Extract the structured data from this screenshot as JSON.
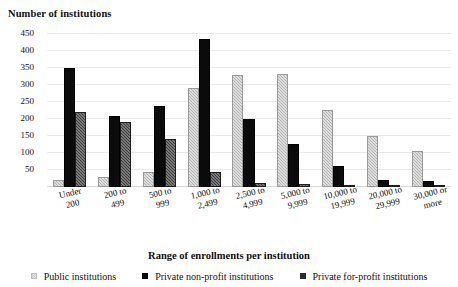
{
  "chart_data": {
    "type": "bar",
    "title": "",
    "ylabel": "Number of institutions",
    "xlabel": "Range of enrollments per institution",
    "ylim": [
      0,
      470
    ],
    "yticks": [
      50,
      100,
      150,
      200,
      250,
      300,
      350,
      400,
      450
    ],
    "grid": true,
    "legend_position": "bottom",
    "categories": [
      "Under\n200",
      "200 to\n499",
      "500 to\n999",
      "1,000 to\n2,499",
      "2,500 to\n4,999",
      "5,000 to\n9,999",
      "10,000 to\n19,999",
      "20,000 to\n29,999",
      "30,000 or\nmore"
    ],
    "series": [
      {
        "name": "Public institutions",
        "color": "#b4b4b4",
        "values": [
          22,
          28,
          44,
          290,
          330,
          332,
          225,
          150,
          105
        ]
      },
      {
        "name": "Private non-profit institutions",
        "color": "#0b0b0b",
        "values": [
          350,
          208,
          238,
          435,
          200,
          125,
          62,
          22,
          18
        ]
      },
      {
        "name": "Private for-profit institutions",
        "color": "#3d3d3d",
        "values": [
          220,
          190,
          140,
          45,
          12,
          8,
          5,
          4,
          6
        ]
      }
    ]
  },
  "legend": {
    "items": [
      {
        "label": "Public institutions",
        "key": "public"
      },
      {
        "label": "Private non-profit institutions",
        "key": "nonprofit"
      },
      {
        "label": "Private for-profit institutions",
        "key": "forprofit"
      }
    ]
  }
}
